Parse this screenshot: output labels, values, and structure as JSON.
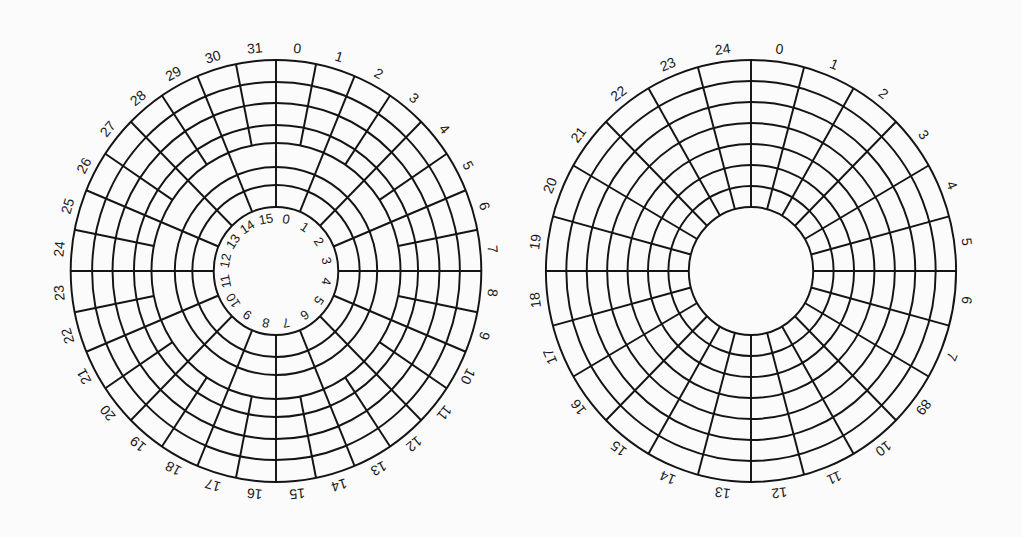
{
  "figure": {
    "title": "Disk track/sector layouts: zoned (left) vs. uniform (right)",
    "background": "#fbfbfb",
    "line_color": "#141414"
  },
  "disks": [
    {
      "name": "zoned-disk",
      "center": [
        276,
        271
      ],
      "rx_scale": 0.973,
      "ring_radii": [
        211,
        189,
        168,
        146,
        128,
        104,
        86,
        64
      ],
      "zones": [
        {
          "name": "outer-zone",
          "r_outer": 211,
          "r_inner": 128,
          "sectors": 32
        },
        {
          "name": "inner-zone",
          "r_outer": 128,
          "r_inner": 64,
          "sectors": 16
        }
      ],
      "outer_labels": {
        "radius": 224,
        "font_size": 14,
        "labels": [
          "0",
          "1",
          "2",
          "3",
          "4",
          "5",
          "6",
          "7",
          "8",
          "9",
          "10",
          "11",
          "12",
          "13",
          "14",
          "15",
          "16",
          "17",
          "18",
          "19",
          "20",
          "21",
          "22",
          "23",
          "24",
          "25",
          "26",
          "27",
          "28",
          "29",
          "30",
          "31"
        ]
      },
      "inner_labels": {
        "radius": 53,
        "font_size": 13,
        "labels": [
          "0",
          "1",
          "2",
          "3",
          "4",
          "5",
          "6",
          "7",
          "8",
          "9",
          "10",
          "11",
          "12",
          "13",
          "14",
          "15"
        ]
      }
    },
    {
      "name": "uniform-disk",
      "center": [
        751,
        271
      ],
      "rx_scale": 0.972,
      "ring_radii": [
        211,
        190,
        169,
        148,
        127,
        106,
        85,
        64
      ],
      "zones": [
        {
          "name": "single-zone",
          "r_outer": 211,
          "r_inner": 64,
          "sectors": 24
        }
      ],
      "outer_labels": {
        "radius": 224,
        "font_size": 14,
        "labels": [
          "0",
          "1",
          "2",
          "3",
          "4",
          "5",
          "6",
          "7",
          "89",
          "10",
          "11",
          "12",
          "13",
          "14",
          "15",
          "16",
          "17",
          "18",
          "19",
          "20",
          "21",
          "22",
          "23",
          "24"
        ]
      }
    }
  ]
}
